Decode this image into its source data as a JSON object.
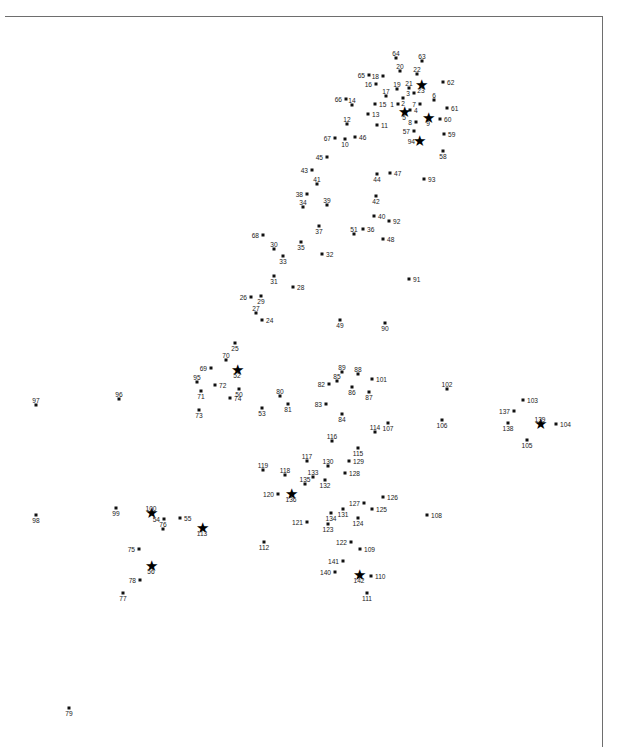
{
  "figure": {
    "type": "scatter",
    "title": "",
    "xlabel": "",
    "ylabel": "",
    "background_color": "#ffffff",
    "point_color": "#111111",
    "frame_color": "#6e6e6e",
    "label_color": "#1a1a1a",
    "frame": {
      "top_y": 16,
      "left_x": 5,
      "right_x": 602,
      "bottom_y": 747
    },
    "marker_styles": [
      "dot",
      "star"
    ],
    "n_points": 142
  },
  "chart_data": {
    "type": "scatter",
    "title": "",
    "xlabel": "",
    "ylabel": "",
    "xlim": [
      0,
      629
    ],
    "ylim": [
      747,
      0
    ],
    "grid": false,
    "legend": null,
    "note": "Labeled point cloud; coordinates are pixel positions of each marker, label text is the point id, marker is dot or star.",
    "points": [
      {
        "id": "1",
        "x": 398,
        "y": 104,
        "marker": "dot",
        "label_pos": "left"
      },
      {
        "id": "2",
        "x": 403,
        "y": 98,
        "marker": "dot",
        "label_pos": "below"
      },
      {
        "id": "3",
        "x": 414,
        "y": 93,
        "marker": "dot",
        "label_pos": "left"
      },
      {
        "id": "4",
        "x": 410,
        "y": 110,
        "marker": "dot",
        "label_pos": "right"
      },
      {
        "id": "5",
        "x": 404,
        "y": 112,
        "marker": "star",
        "label_pos": "below"
      },
      {
        "id": "6",
        "x": 434,
        "y": 100,
        "marker": "dot",
        "label_pos": "above"
      },
      {
        "id": "7",
        "x": 420,
        "y": 104,
        "marker": "dot",
        "label_pos": "left"
      },
      {
        "id": "8",
        "x": 416,
        "y": 122,
        "marker": "dot",
        "label_pos": "left"
      },
      {
        "id": "9",
        "x": 428,
        "y": 118,
        "marker": "star",
        "label_pos": "below"
      },
      {
        "id": "10",
        "x": 345,
        "y": 139,
        "marker": "dot",
        "label_pos": "below"
      },
      {
        "id": "11",
        "x": 377,
        "y": 125,
        "marker": "dot",
        "label_pos": "right"
      },
      {
        "id": "12",
        "x": 347,
        "y": 124,
        "marker": "dot",
        "label_pos": "above"
      },
      {
        "id": "13",
        "x": 368,
        "y": 114,
        "marker": "dot",
        "label_pos": "right"
      },
      {
        "id": "14",
        "x": 352,
        "y": 105,
        "marker": "dot",
        "label_pos": "above"
      },
      {
        "id": "15",
        "x": 375,
        "y": 104,
        "marker": "dot",
        "label_pos": "right"
      },
      {
        "id": "16",
        "x": 376,
        "y": 84,
        "marker": "dot",
        "label_pos": "left"
      },
      {
        "id": "17",
        "x": 386,
        "y": 96,
        "marker": "dot",
        "label_pos": "above"
      },
      {
        "id": "18",
        "x": 383,
        "y": 76,
        "marker": "dot",
        "label_pos": "left"
      },
      {
        "id": "19",
        "x": 397,
        "y": 89,
        "marker": "dot",
        "label_pos": "above"
      },
      {
        "id": "20",
        "x": 400,
        "y": 71,
        "marker": "dot",
        "label_pos": "above"
      },
      {
        "id": "21",
        "x": 409,
        "y": 88,
        "marker": "dot",
        "label_pos": "above"
      },
      {
        "id": "22",
        "x": 417,
        "y": 74,
        "marker": "dot",
        "label_pos": "above"
      },
      {
        "id": "23",
        "x": 421,
        "y": 85,
        "marker": "star",
        "label_pos": "below"
      },
      {
        "id": "24",
        "x": 262,
        "y": 320,
        "marker": "dot",
        "label_pos": "right"
      },
      {
        "id": "25",
        "x": 235,
        "y": 343,
        "marker": "dot",
        "label_pos": "below"
      },
      {
        "id": "26",
        "x": 251,
        "y": 297,
        "marker": "dot",
        "label_pos": "left"
      },
      {
        "id": "27",
        "x": 256,
        "y": 313,
        "marker": "dot",
        "label_pos": "above"
      },
      {
        "id": "28",
        "x": 293,
        "y": 287,
        "marker": "dot",
        "label_pos": "right"
      },
      {
        "id": "29",
        "x": 261,
        "y": 296,
        "marker": "dot",
        "label_pos": "below"
      },
      {
        "id": "30",
        "x": 274,
        "y": 249,
        "marker": "dot",
        "label_pos": "above"
      },
      {
        "id": "31",
        "x": 274,
        "y": 276,
        "marker": "dot",
        "label_pos": "below"
      },
      {
        "id": "32",
        "x": 322,
        "y": 254,
        "marker": "dot",
        "label_pos": "right"
      },
      {
        "id": "33",
        "x": 283,
        "y": 256,
        "marker": "dot",
        "label_pos": "below"
      },
      {
        "id": "34",
        "x": 303,
        "y": 207,
        "marker": "dot",
        "label_pos": "above"
      },
      {
        "id": "35",
        "x": 301,
        "y": 242,
        "marker": "dot",
        "label_pos": "below"
      },
      {
        "id": "36",
        "x": 363,
        "y": 229,
        "marker": "dot",
        "label_pos": "right"
      },
      {
        "id": "37",
        "x": 319,
        "y": 226,
        "marker": "dot",
        "label_pos": "below"
      },
      {
        "id": "38",
        "x": 307,
        "y": 194,
        "marker": "dot",
        "label_pos": "left"
      },
      {
        "id": "39",
        "x": 327,
        "y": 205,
        "marker": "dot",
        "label_pos": "above"
      },
      {
        "id": "40",
        "x": 374,
        "y": 216,
        "marker": "dot",
        "label_pos": "right"
      },
      {
        "id": "41",
        "x": 317,
        "y": 184,
        "marker": "dot",
        "label_pos": "above"
      },
      {
        "id": "42",
        "x": 376,
        "y": 196,
        "marker": "dot",
        "label_pos": "below"
      },
      {
        "id": "43",
        "x": 312,
        "y": 170,
        "marker": "dot",
        "label_pos": "left"
      },
      {
        "id": "44",
        "x": 377,
        "y": 174,
        "marker": "dot",
        "label_pos": "below"
      },
      {
        "id": "45",
        "x": 327,
        "y": 157,
        "marker": "dot",
        "label_pos": "left"
      },
      {
        "id": "46",
        "x": 355,
        "y": 137,
        "marker": "dot",
        "label_pos": "right"
      },
      {
        "id": "47",
        "x": 390,
        "y": 173,
        "marker": "dot",
        "label_pos": "right"
      },
      {
        "id": "48",
        "x": 383,
        "y": 239,
        "marker": "dot",
        "label_pos": "right"
      },
      {
        "id": "49",
        "x": 340,
        "y": 320,
        "marker": "dot",
        "label_pos": "below"
      },
      {
        "id": "50",
        "x": 239,
        "y": 389,
        "marker": "dot",
        "label_pos": "below"
      },
      {
        "id": "51",
        "x": 354,
        "y": 234,
        "marker": "dot",
        "label_pos": "above"
      },
      {
        "id": "52",
        "x": 237,
        "y": 370,
        "marker": "star",
        "label_pos": "below"
      },
      {
        "id": "53",
        "x": 262,
        "y": 408,
        "marker": "dot",
        "label_pos": "below"
      },
      {
        "id": "54",
        "x": 164,
        "y": 519,
        "marker": "dot",
        "label_pos": "left"
      },
      {
        "id": "55",
        "x": 180,
        "y": 518,
        "marker": "dot",
        "label_pos": "right"
      },
      {
        "id": "56",
        "x": 151,
        "y": 566,
        "marker": "star",
        "label_pos": "below"
      },
      {
        "id": "57",
        "x": 414,
        "y": 131,
        "marker": "dot",
        "label_pos": "left"
      },
      {
        "id": "58",
        "x": 443,
        "y": 151,
        "marker": "dot",
        "label_pos": "below"
      },
      {
        "id": "59",
        "x": 444,
        "y": 134,
        "marker": "dot",
        "label_pos": "right"
      },
      {
        "id": "60",
        "x": 440,
        "y": 119,
        "marker": "dot",
        "label_pos": "right"
      },
      {
        "id": "61",
        "x": 447,
        "y": 108,
        "marker": "dot",
        "label_pos": "right"
      },
      {
        "id": "62",
        "x": 443,
        "y": 82,
        "marker": "dot",
        "label_pos": "right"
      },
      {
        "id": "63",
        "x": 422,
        "y": 61,
        "marker": "dot",
        "label_pos": "above"
      },
      {
        "id": "64",
        "x": 396,
        "y": 58,
        "marker": "dot",
        "label_pos": "above"
      },
      {
        "id": "65",
        "x": 369,
        "y": 75,
        "marker": "dot",
        "label_pos": "left"
      },
      {
        "id": "66",
        "x": 346,
        "y": 99,
        "marker": "dot",
        "label_pos": "left"
      },
      {
        "id": "67",
        "x": 335,
        "y": 138,
        "marker": "dot",
        "label_pos": "left"
      },
      {
        "id": "68",
        "x": 263,
        "y": 235,
        "marker": "dot",
        "label_pos": "left"
      },
      {
        "id": "69",
        "x": 211,
        "y": 368,
        "marker": "dot",
        "label_pos": "left"
      },
      {
        "id": "70",
        "x": 226,
        "y": 360,
        "marker": "dot",
        "label_pos": "above"
      },
      {
        "id": "71",
        "x": 201,
        "y": 391,
        "marker": "dot",
        "label_pos": "below"
      },
      {
        "id": "72",
        "x": 215,
        "y": 385,
        "marker": "dot",
        "label_pos": "right"
      },
      {
        "id": "73",
        "x": 199,
        "y": 410,
        "marker": "dot",
        "label_pos": "below"
      },
      {
        "id": "74",
        "x": 230,
        "y": 398,
        "marker": "dot",
        "label_pos": "right"
      },
      {
        "id": "75",
        "x": 139,
        "y": 549,
        "marker": "dot",
        "label_pos": "left"
      },
      {
        "id": "76",
        "x": 163,
        "y": 529,
        "marker": "dot",
        "label_pos": "above"
      },
      {
        "id": "77",
        "x": 123,
        "y": 593,
        "marker": "dot",
        "label_pos": "below"
      },
      {
        "id": "78",
        "x": 140,
        "y": 580,
        "marker": "dot",
        "label_pos": "left"
      },
      {
        "id": "79",
        "x": 69,
        "y": 708,
        "marker": "dot",
        "label_pos": "below"
      },
      {
        "id": "80",
        "x": 280,
        "y": 396,
        "marker": "dot",
        "label_pos": "above"
      },
      {
        "id": "81",
        "x": 288,
        "y": 404,
        "marker": "dot",
        "label_pos": "below"
      },
      {
        "id": "82",
        "x": 329,
        "y": 384,
        "marker": "dot",
        "label_pos": "left"
      },
      {
        "id": "83",
        "x": 326,
        "y": 404,
        "marker": "dot",
        "label_pos": "left"
      },
      {
        "id": "84",
        "x": 342,
        "y": 414,
        "marker": "dot",
        "label_pos": "below"
      },
      {
        "id": "85",
        "x": 337,
        "y": 381,
        "marker": "dot",
        "label_pos": "above"
      },
      {
        "id": "86",
        "x": 352,
        "y": 387,
        "marker": "dot",
        "label_pos": "below"
      },
      {
        "id": "87",
        "x": 369,
        "y": 392,
        "marker": "dot",
        "label_pos": "below"
      },
      {
        "id": "88",
        "x": 358,
        "y": 374,
        "marker": "dot",
        "label_pos": "above"
      },
      {
        "id": "89",
        "x": 342,
        "y": 372,
        "marker": "dot",
        "label_pos": "above"
      },
      {
        "id": "90",
        "x": 385,
        "y": 323,
        "marker": "dot",
        "label_pos": "below"
      },
      {
        "id": "91",
        "x": 409,
        "y": 279,
        "marker": "dot",
        "label_pos": "right"
      },
      {
        "id": "92",
        "x": 389,
        "y": 221,
        "marker": "dot",
        "label_pos": "right"
      },
      {
        "id": "93",
        "x": 424,
        "y": 179,
        "marker": "dot",
        "label_pos": "right"
      },
      {
        "id": "94",
        "x": 419,
        "y": 141,
        "marker": "star",
        "label_pos": "left"
      },
      {
        "id": "95",
        "x": 197,
        "y": 382,
        "marker": "dot",
        "label_pos": "above"
      },
      {
        "id": "96",
        "x": 119,
        "y": 399,
        "marker": "dot",
        "label_pos": "above"
      },
      {
        "id": "97",
        "x": 36,
        "y": 405,
        "marker": "dot",
        "label_pos": "above"
      },
      {
        "id": "98",
        "x": 36,
        "y": 515,
        "marker": "dot",
        "label_pos": "below"
      },
      {
        "id": "99",
        "x": 116,
        "y": 508,
        "marker": "dot",
        "label_pos": "below"
      },
      {
        "id": "100",
        "x": 151,
        "y": 513,
        "marker": "star",
        "label_pos": "above"
      },
      {
        "id": "101",
        "x": 372,
        "y": 379,
        "marker": "dot",
        "label_pos": "right"
      },
      {
        "id": "102",
        "x": 447,
        "y": 389,
        "marker": "dot",
        "label_pos": "above"
      },
      {
        "id": "103",
        "x": 523,
        "y": 400,
        "marker": "dot",
        "label_pos": "right"
      },
      {
        "id": "104",
        "x": 556,
        "y": 424,
        "marker": "dot",
        "label_pos": "right"
      },
      {
        "id": "105",
        "x": 527,
        "y": 440,
        "marker": "dot",
        "label_pos": "below"
      },
      {
        "id": "106",
        "x": 442,
        "y": 420,
        "marker": "dot",
        "label_pos": "below"
      },
      {
        "id": "107",
        "x": 388,
        "y": 423,
        "marker": "dot",
        "label_pos": "below"
      },
      {
        "id": "108",
        "x": 427,
        "y": 515,
        "marker": "dot",
        "label_pos": "right"
      },
      {
        "id": "109",
        "x": 360,
        "y": 549,
        "marker": "dot",
        "label_pos": "right"
      },
      {
        "id": "110",
        "x": 371,
        "y": 576,
        "marker": "dot",
        "label_pos": "right"
      },
      {
        "id": "111",
        "x": 367,
        "y": 593,
        "marker": "dot",
        "label_pos": "below"
      },
      {
        "id": "112",
        "x": 264,
        "y": 542,
        "marker": "dot",
        "label_pos": "below"
      },
      {
        "id": "113",
        "x": 202,
        "y": 528,
        "marker": "star",
        "label_pos": "below"
      },
      {
        "id": "114",
        "x": 375,
        "y": 432,
        "marker": "dot",
        "label_pos": "above"
      },
      {
        "id": "115",
        "x": 358,
        "y": 448,
        "marker": "dot",
        "label_pos": "below"
      },
      {
        "id": "116",
        "x": 332,
        "y": 441,
        "marker": "dot",
        "label_pos": "above"
      },
      {
        "id": "117",
        "x": 307,
        "y": 461,
        "marker": "dot",
        "label_pos": "above"
      },
      {
        "id": "118",
        "x": 285,
        "y": 475,
        "marker": "dot",
        "label_pos": "above"
      },
      {
        "id": "119",
        "x": 263,
        "y": 470,
        "marker": "dot",
        "label_pos": "above"
      },
      {
        "id": "120",
        "x": 278,
        "y": 494,
        "marker": "dot",
        "label_pos": "left"
      },
      {
        "id": "121",
        "x": 307,
        "y": 522,
        "marker": "dot",
        "label_pos": "left"
      },
      {
        "id": "122",
        "x": 351,
        "y": 542,
        "marker": "dot",
        "label_pos": "left"
      },
      {
        "id": "123",
        "x": 328,
        "y": 524,
        "marker": "dot",
        "label_pos": "below"
      },
      {
        "id": "124",
        "x": 358,
        "y": 518,
        "marker": "dot",
        "label_pos": "below"
      },
      {
        "id": "125",
        "x": 372,
        "y": 509,
        "marker": "dot",
        "label_pos": "right"
      },
      {
        "id": "126",
        "x": 383,
        "y": 497,
        "marker": "dot",
        "label_pos": "right"
      },
      {
        "id": "127",
        "x": 364,
        "y": 503,
        "marker": "dot",
        "label_pos": "left"
      },
      {
        "id": "128",
        "x": 345,
        "y": 473,
        "marker": "dot",
        "label_pos": "right"
      },
      {
        "id": "129",
        "x": 349,
        "y": 461,
        "marker": "dot",
        "label_pos": "right"
      },
      {
        "id": "130",
        "x": 328,
        "y": 466,
        "marker": "dot",
        "label_pos": "above"
      },
      {
        "id": "131",
        "x": 343,
        "y": 509,
        "marker": "dot",
        "label_pos": "below"
      },
      {
        "id": "132",
        "x": 325,
        "y": 480,
        "marker": "dot",
        "label_pos": "below"
      },
      {
        "id": "133",
        "x": 313,
        "y": 477,
        "marker": "dot",
        "label_pos": "above"
      },
      {
        "id": "134",
        "x": 331,
        "y": 513,
        "marker": "dot",
        "label_pos": "below"
      },
      {
        "id": "135",
        "x": 305,
        "y": 484,
        "marker": "dot",
        "label_pos": "above"
      },
      {
        "id": "136",
        "x": 291,
        "y": 494,
        "marker": "star",
        "label_pos": "below"
      },
      {
        "id": "137",
        "x": 514,
        "y": 411,
        "marker": "dot",
        "label_pos": "left"
      },
      {
        "id": "138",
        "x": 508,
        "y": 423,
        "marker": "dot",
        "label_pos": "below"
      },
      {
        "id": "139",
        "x": 540,
        "y": 424,
        "marker": "star",
        "label_pos": "above"
      },
      {
        "id": "140",
        "x": 335,
        "y": 572,
        "marker": "dot",
        "label_pos": "left"
      },
      {
        "id": "141",
        "x": 343,
        "y": 561,
        "marker": "dot",
        "label_pos": "left"
      },
      {
        "id": "142",
        "x": 359,
        "y": 575,
        "marker": "star",
        "label_pos": "below"
      }
    ]
  }
}
